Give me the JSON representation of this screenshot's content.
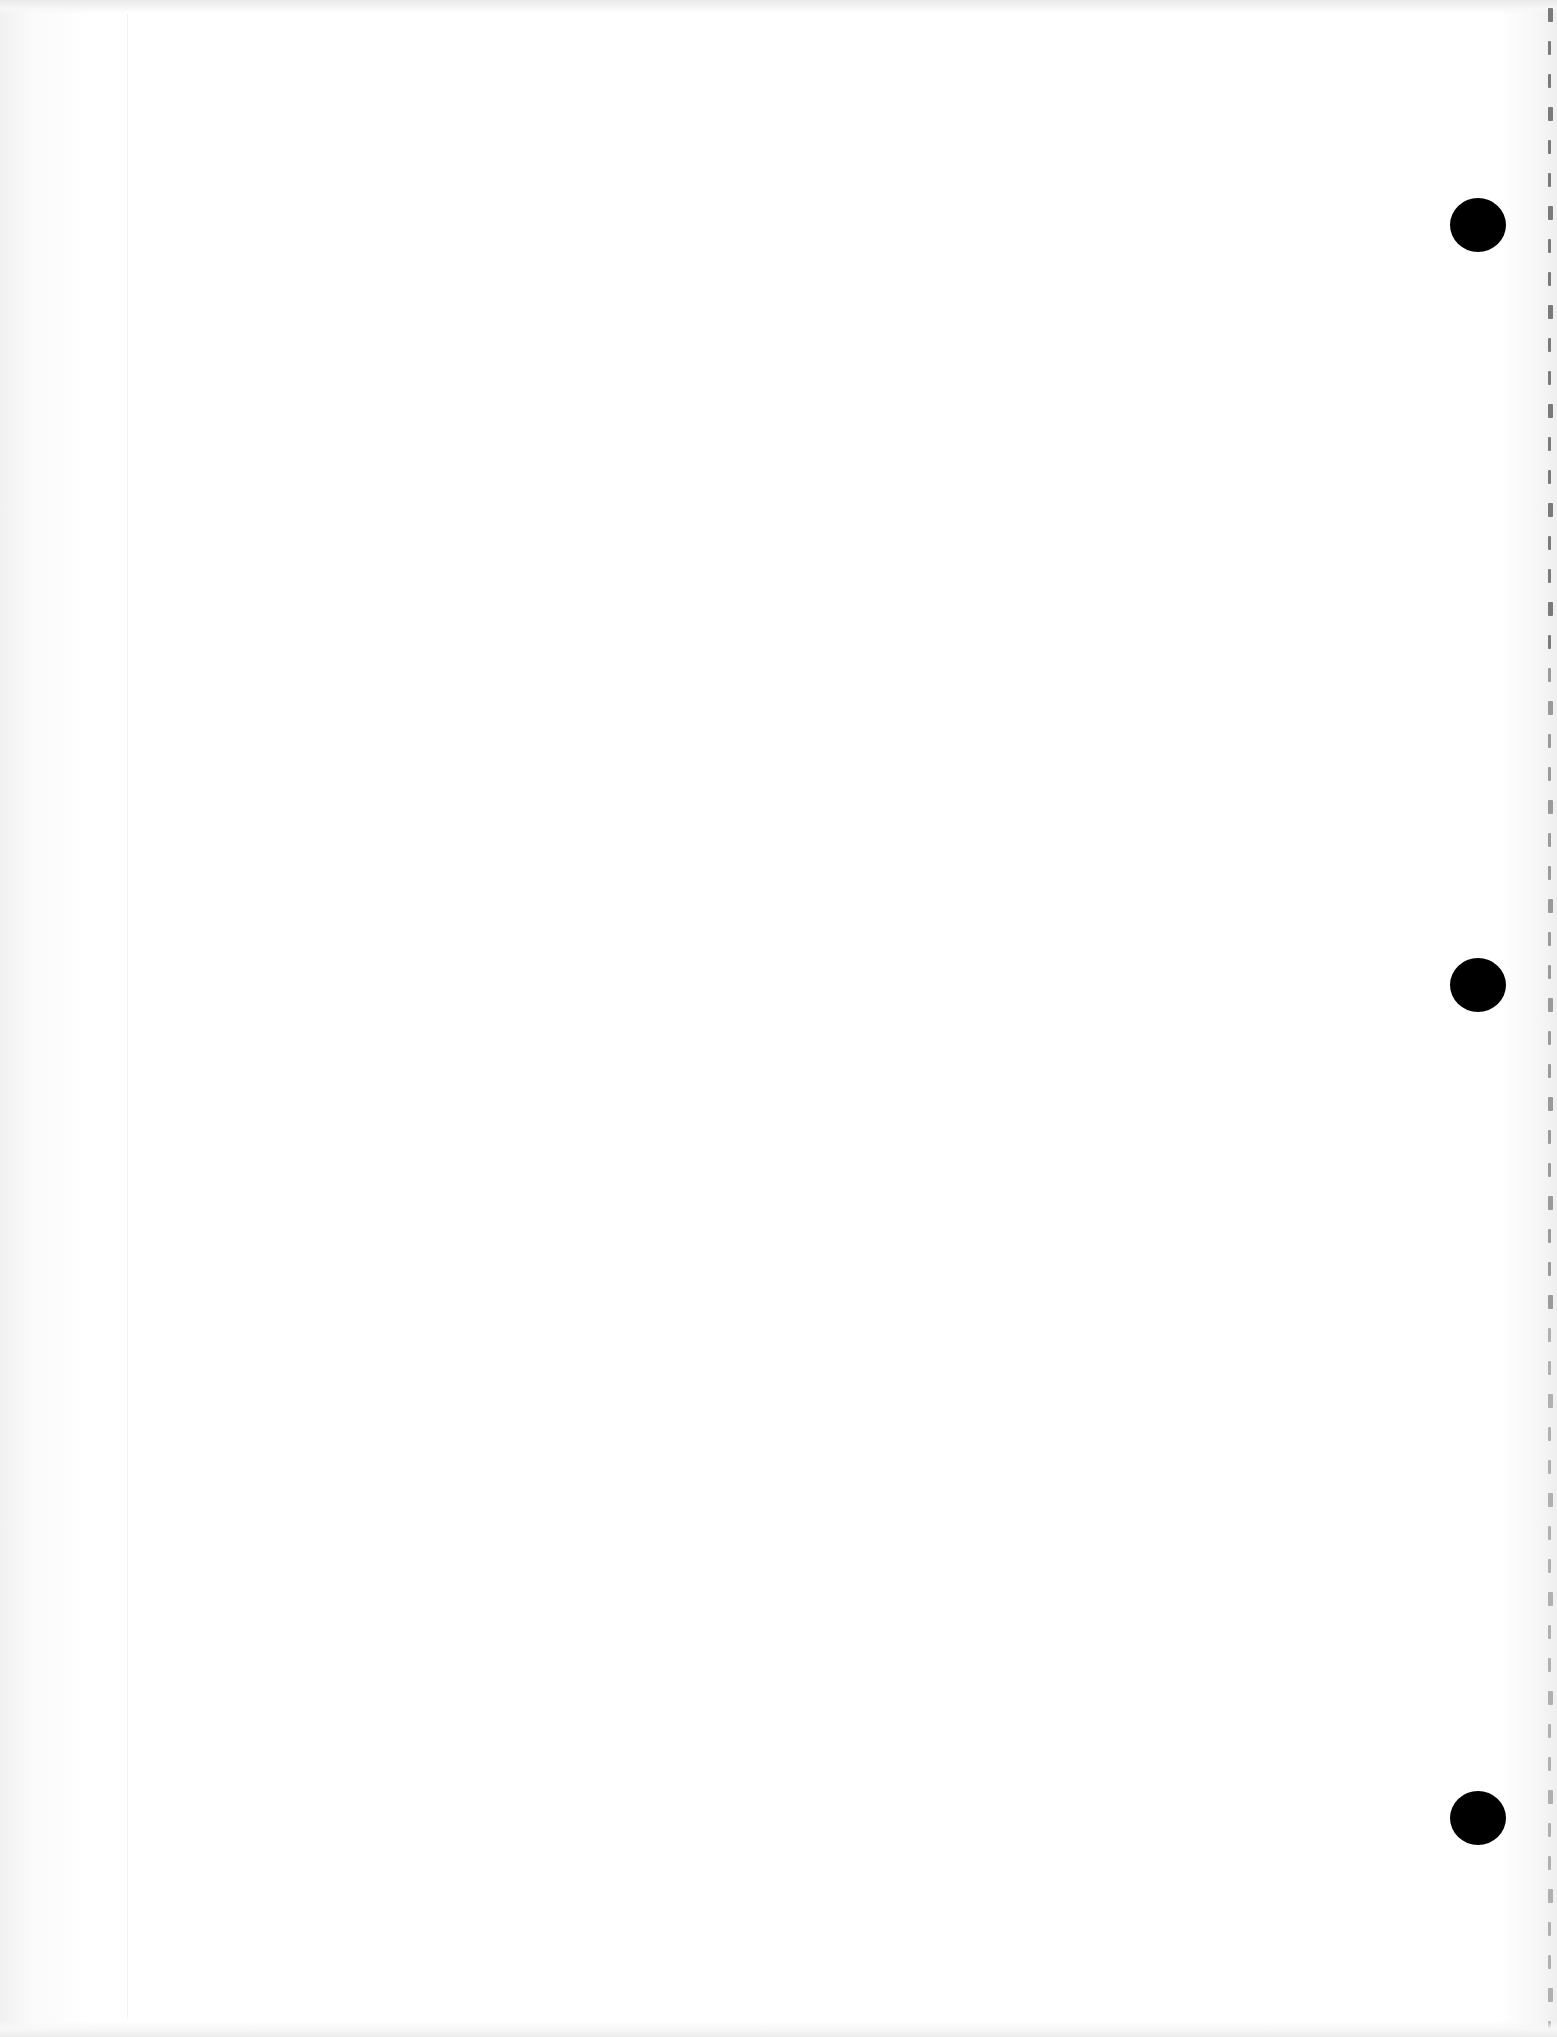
{
  "page": {
    "type": "blank-notebook-sheet",
    "background_color": "#ffffff",
    "text_content": []
  },
  "holes": [
    {
      "name": "punch-hole-top",
      "cx": 1478,
      "cy": 225,
      "color": "#000000"
    },
    {
      "name": "punch-hole-middle",
      "cx": 1478,
      "cy": 985,
      "color": "#000000"
    },
    {
      "name": "punch-hole-bottom",
      "cx": 1478,
      "cy": 1818,
      "color": "#000000"
    }
  ],
  "perforation": {
    "x": 1548,
    "start_y": 8,
    "spacing": 33,
    "count": 62,
    "color": "#7a7a7a"
  }
}
